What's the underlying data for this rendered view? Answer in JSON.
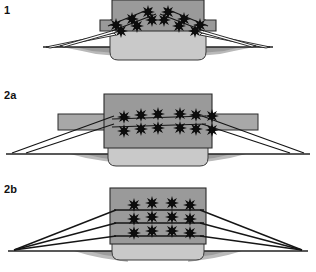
{
  "figure": {
    "title": "",
    "background_color": "#ffffff",
    "width": 316,
    "height": 272
  },
  "palette": {
    "body_upper_gray": "#9a9a9a",
    "body_lower_gray": "#c9c9c9",
    "wing_gray": "#a8a8a8",
    "outline": "#1a1a1a",
    "star_color": "#0d0d0d",
    "ground_line": "#222222",
    "shadow_gray": "#b4b4b4",
    "shadow_dark": "#8e8e8e",
    "label_color": "#111111"
  },
  "panels": [
    {
      "id": "panel-1",
      "label": "1",
      "description": "narrow central body with stepped shoulders; two angled rows of charges; paired rays to ground",
      "star_rows": 2,
      "star_columns": 6,
      "star_count": 12,
      "ray_count_per_side": 2,
      "ground_level_y": 47
    },
    {
      "id": "panel-2a",
      "label": "2a",
      "description": "wider body with horizontal side wings; two horizontal rows of charges; shallow rays to ground",
      "star_rows": 2,
      "star_columns": 6,
      "star_count": 12,
      "ray_count_per_side": 2,
      "ground_level_y": 68
    },
    {
      "id": "panel-2b",
      "label": "2b",
      "description": "broad rectangular body; three rows of charges; three rays per side converging at ground",
      "star_rows": 3,
      "star_columns": 4,
      "star_count": 12,
      "ray_count_per_side": 3,
      "ground_level_y": 45
    }
  ]
}
